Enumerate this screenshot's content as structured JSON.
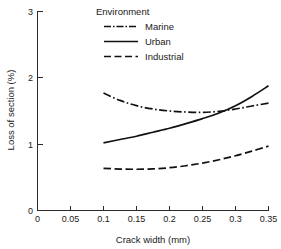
{
  "chart_data": {
    "type": "line",
    "title": "",
    "xlabel": "Crack width (mm)",
    "ylabel": "Loss of section (%)",
    "xlim": [
      0,
      0.35
    ],
    "ylim": [
      0,
      3
    ],
    "grid": false,
    "legend_title": "Environment",
    "legend_position": "top-center",
    "xticks": [
      "0",
      "0.05",
      "0.1",
      "0.15",
      "0.2",
      "0.25",
      "0.3",
      "0.35"
    ],
    "xtick_values": [
      0,
      0.05,
      0.1,
      0.15,
      0.2,
      0.25,
      0.3,
      0.35
    ],
    "yticks": [
      "0",
      "1",
      "2",
      "3"
    ],
    "ytick_values": [
      0,
      1,
      2,
      3
    ],
    "x": [
      0.1,
      0.125,
      0.15,
      0.175,
      0.2,
      0.225,
      0.25,
      0.275,
      0.3,
      0.325,
      0.35
    ],
    "series": [
      {
        "name": "Marine",
        "linestyle": "dash-dot",
        "color": "#111111",
        "values": [
          1.77,
          1.66,
          1.58,
          1.53,
          1.5,
          1.485,
          1.48,
          1.495,
          1.53,
          1.575,
          1.62
        ]
      },
      {
        "name": "Urban",
        "linestyle": "solid",
        "color": "#111111",
        "values": [
          1.02,
          1.07,
          1.12,
          1.18,
          1.24,
          1.31,
          1.385,
          1.47,
          1.58,
          1.72,
          1.88
        ]
      },
      {
        "name": "Industrial",
        "linestyle": "dashed",
        "color": "#111111",
        "values": [
          0.635,
          0.625,
          0.622,
          0.628,
          0.645,
          0.675,
          0.715,
          0.765,
          0.825,
          0.895,
          0.97
        ]
      }
    ]
  },
  "legend": {
    "title": "Environment",
    "items": [
      {
        "label": "Marine",
        "dash": "7 2 1.5 2"
      },
      {
        "label": "Urban",
        "dash": "none"
      },
      {
        "label": "Industrial",
        "dash": "7 3.5"
      }
    ]
  },
  "axes": {
    "x_title": "Crack width (mm)",
    "y_title": "Loss of section (%)"
  }
}
